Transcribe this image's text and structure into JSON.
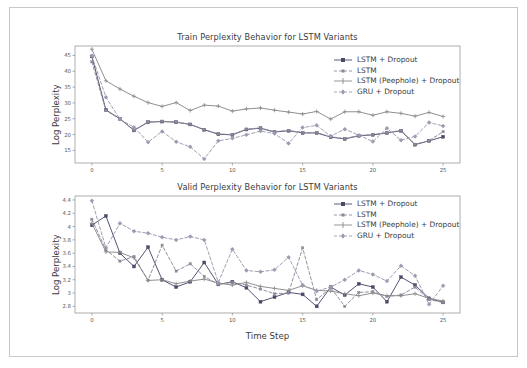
{
  "figure": {
    "background_color": "#ffffff",
    "frame_color": "#c8c8c8"
  },
  "series_styles": [
    {
      "name": "LSTM + Dropout",
      "color": "#4a4a6a",
      "dash": "none",
      "marker": "square"
    },
    {
      "name": "LSTM",
      "color": "#8a8a9a",
      "dash": "dashed",
      "marker": "square"
    },
    {
      "name": "LSTM (Peephole) + Dropout",
      "color": "#8a8a8a",
      "dash": "none",
      "marker": "plus"
    },
    {
      "name": "GRU + Dropout",
      "color": "#9a9ab0",
      "dash": "dashed",
      "marker": "diamond"
    }
  ],
  "chart_data": [
    {
      "type": "line",
      "id": "train",
      "title": "Train Perplexity Behavior for LSTM Variants",
      "xlabel": "",
      "ylabel": "Log Perplexity",
      "xlim": [
        -1.2,
        26.2
      ],
      "ylim": [
        11.0,
        48.0
      ],
      "xticks": [
        0,
        5,
        10,
        15,
        20,
        25
      ],
      "yticks": [
        15,
        20,
        25,
        30,
        35,
        40,
        45
      ],
      "grid": false,
      "legend_position": "upper right",
      "x": [
        0,
        1,
        2,
        3,
        4,
        5,
        6,
        7,
        8,
        9,
        10,
        11,
        12,
        13,
        14,
        15,
        16,
        17,
        18,
        19,
        20,
        21,
        22,
        23,
        24,
        25
      ],
      "series": [
        {
          "name": "LSTM + Dropout",
          "values": [
            44.7,
            27.8,
            25.0,
            21.3,
            23.9,
            24.1,
            23.9,
            23.2,
            21.5,
            20.1,
            19.9,
            21.6,
            22.0,
            20.8,
            21.2,
            20.5,
            20.5,
            19.2,
            18.6,
            19.6,
            19.9,
            20.5,
            21.2,
            16.8,
            18.0,
            19.3
          ]
        },
        {
          "name": "LSTM",
          "values": [
            43.0,
            27.6,
            24.9,
            21.4,
            24.0,
            24.2,
            24.0,
            23.2,
            21.6,
            20.2,
            20.0,
            21.7,
            22.1,
            20.9,
            21.3,
            20.6,
            20.6,
            19.3,
            18.7,
            19.7,
            20.0,
            20.6,
            21.3,
            16.9,
            18.1,
            20.9
          ]
        },
        {
          "name": "LSTM (Peephole) + Dropout",
          "values": [
            47.0,
            37.0,
            34.4,
            32.1,
            30.1,
            28.9,
            30.1,
            27.6,
            29.3,
            29.0,
            27.4,
            28.1,
            28.4,
            27.7,
            27.1,
            26.5,
            27.3,
            24.9,
            27.2,
            27.2,
            26.1,
            27.2,
            26.7,
            25.8,
            27.0,
            25.7
          ]
        },
        {
          "name": "GRU + Dropout",
          "values": [
            44.9,
            31.8,
            24.9,
            22.3,
            17.6,
            21.0,
            17.7,
            16.1,
            12.3,
            18.0,
            18.8,
            19.9,
            21.1,
            20.3,
            17.2,
            22.2,
            22.9,
            19.5,
            21.7,
            19.8,
            17.8,
            22.0,
            18.2,
            19.4,
            23.8,
            22.7
          ]
        }
      ]
    },
    {
      "type": "line",
      "id": "valid",
      "title": "Valid Perplexity Behavior for LSTM Variants",
      "xlabel": "Time Step",
      "ylabel": "Log Perplexity",
      "xlim": [
        -1.2,
        26.2
      ],
      "ylim": [
        2.7,
        4.46
      ],
      "xticks": [
        0,
        5,
        10,
        15,
        20,
        25
      ],
      "yticks": [
        2.8,
        3.0,
        3.2,
        3.4,
        3.6,
        3.8,
        4.0,
        4.2,
        4.4
      ],
      "grid": false,
      "legend_position": "upper right",
      "x": [
        0,
        1,
        2,
        3,
        4,
        5,
        6,
        7,
        8,
        9,
        10,
        11,
        12,
        13,
        14,
        15,
        16,
        17,
        18,
        19,
        20,
        21,
        22,
        23,
        24,
        25
      ],
      "series": [
        {
          "name": "LSTM + Dropout",
          "values": [
            4.02,
            4.16,
            3.6,
            3.4,
            3.69,
            3.2,
            3.09,
            3.17,
            3.46,
            3.13,
            3.17,
            3.08,
            2.87,
            2.94,
            3.01,
            2.98,
            2.8,
            3.09,
            2.97,
            3.14,
            3.09,
            2.87,
            3.24,
            3.12,
            2.92,
            2.86
          ]
        },
        {
          "name": "LSTM",
          "values": [
            4.11,
            3.65,
            3.48,
            3.55,
            3.19,
            3.72,
            3.33,
            3.44,
            3.25,
            3.13,
            3.16,
            3.12,
            3.06,
            2.99,
            3.0,
            3.68,
            2.9,
            3.08,
            2.8,
            3.01,
            3.02,
            2.95,
            2.97,
            3.09,
            2.9,
            2.86
          ]
        },
        {
          "name": "LSTM (Peephole) + Dropout",
          "values": [
            4.05,
            3.62,
            3.61,
            3.53,
            3.19,
            3.2,
            3.14,
            3.18,
            3.21,
            3.15,
            3.12,
            3.16,
            3.1,
            3.07,
            3.04,
            3.11,
            3.04,
            3.03,
            2.99,
            2.96,
            3.0,
            2.96,
            2.96,
            2.99,
            2.92,
            2.88
          ]
        },
        {
          "name": "GRU + Dropout",
          "values": [
            4.39,
            3.68,
            4.05,
            3.93,
            3.9,
            3.84,
            3.8,
            3.85,
            3.8,
            3.16,
            3.66,
            3.34,
            3.32,
            3.35,
            3.54,
            3.12,
            3.03,
            3.09,
            3.2,
            3.34,
            3.28,
            3.18,
            3.41,
            3.26,
            2.83,
            3.11
          ]
        }
      ]
    }
  ],
  "legend": {
    "entries": [
      "LSTM + Dropout",
      "LSTM",
      "LSTM (Peephole) + Dropout",
      "GRU + Dropout"
    ]
  }
}
